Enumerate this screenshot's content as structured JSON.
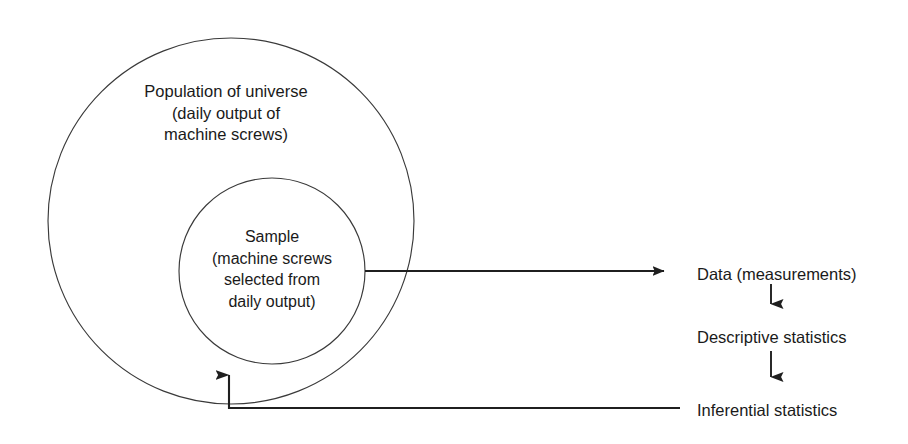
{
  "diagram": {
    "stroke_color": "#2b2b2b",
    "text_color": "#1a1a1a",
    "background_color": "#ffffff",
    "outer_circle": {
      "name": "population-circle",
      "cx": 231,
      "cy": 221,
      "r": 183,
      "label_lines": [
        "Population of universe",
        "(daily output of",
        "machine screws)"
      ]
    },
    "inner_circle": {
      "name": "sample-circle",
      "cx": 272,
      "cy": 271,
      "r": 93,
      "label_lines": [
        "Sample",
        "(machine screws",
        "selected from",
        "daily output)"
      ]
    },
    "nodes": [
      {
        "id": "data",
        "label": "Data (measurements)",
        "x": 697,
        "y": 274
      },
      {
        "id": "descriptive",
        "label": "Descriptive statistics",
        "x": 697,
        "y": 337
      },
      {
        "id": "inferential",
        "label": "Inferential statistics",
        "x": 697,
        "y": 410
      }
    ],
    "connectors": [
      {
        "id": "sample-to-data",
        "from": "sample-circle",
        "to": "data",
        "type": "horizontal-arrow-right",
        "x1": 365,
        "y1": 271,
        "x2": 673,
        "y2": 271
      },
      {
        "id": "data-to-descriptive",
        "from": "data",
        "to": "descriptive",
        "type": "vertical-arrow-down",
        "x1": 771,
        "y1": 284,
        "x2": 771,
        "y2": 316
      },
      {
        "id": "descriptive-to-inferential",
        "from": "descriptive",
        "to": "inferential",
        "type": "vertical-arrow-down",
        "x1": 771,
        "y1": 351,
        "x2": 771,
        "y2": 389
      },
      {
        "id": "inferential-to-population",
        "from": "inferential",
        "to": "population-circle",
        "type": "elbow-arrow-up",
        "x1": 680,
        "y1": 408,
        "x2": 229,
        "y2": 408,
        "x3": 229,
        "y3": 361
      }
    ]
  }
}
